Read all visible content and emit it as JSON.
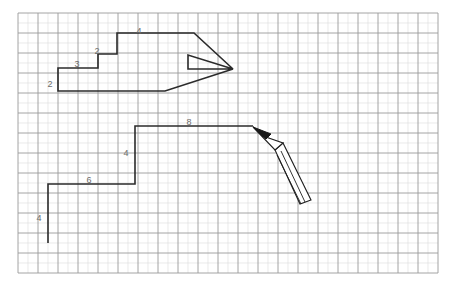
{
  "canvas": {
    "width": 452,
    "height": 288,
    "background_color": "#ffffff"
  },
  "grid": {
    "name": "graph-paper-grid",
    "origin_x": 18,
    "origin_y": 13,
    "cell_size": 20,
    "sub_divisions": 2,
    "columns": 21,
    "rows": 13,
    "major_line_color": "#9a9a9a",
    "minor_line_color": "#dcdcdc",
    "major_line_width": 0.9,
    "minor_line_width": 0.6
  },
  "drawing": {
    "stroke_color": "#2b2b2b",
    "stroke_width": 1.6,
    "label_color": "#6d6d6d",
    "shapes": [
      {
        "id": "arrow-polygon",
        "name": "arrow-shape",
        "type": "polygon",
        "closed": true,
        "points": [
          [
            58,
            68
          ],
          [
            58,
            91
          ],
          [
            165,
            91
          ],
          [
            233,
            69
          ],
          [
            188,
            69
          ],
          [
            188,
            55
          ],
          [
            233,
            69
          ],
          [
            194,
            33
          ],
          [
            117,
            33
          ],
          [
            117,
            54
          ],
          [
            98,
            54
          ],
          [
            98,
            68
          ]
        ],
        "path": "M 58 68 L 58 91 L 165 91 L 233 69 L 188 69 L 188 55 L 233 69 L 194 33 L 117 33 L 117 54 L 98 54 L 98 68 Z"
      },
      {
        "id": "staircase-polyline",
        "name": "staircase-shape",
        "type": "polyline",
        "closed": false,
        "points": [
          [
            48,
            243
          ],
          [
            48,
            184
          ],
          [
            135,
            184
          ],
          [
            135,
            126
          ],
          [
            253,
            126
          ]
        ],
        "path": "M 48 243 L 48 184 L 135 184 L 135 126 L 253 126"
      }
    ],
    "labels": [
      {
        "id": "label-arrow-left-2",
        "name": "length-label-2-left",
        "text": "2",
        "x": 50,
        "y": 85
      },
      {
        "id": "label-arrow-top-3",
        "name": "length-label-3-top",
        "text": "3",
        "x": 77,
        "y": 65
      },
      {
        "id": "label-arrow-step-2",
        "name": "length-label-2-step",
        "text": "2",
        "x": 97,
        "y": 52
      },
      {
        "id": "label-arrow-top-4",
        "name": "length-label-4-top",
        "text": "4",
        "x": 139,
        "y": 32
      },
      {
        "id": "label-stair-8",
        "name": "length-label-8-top",
        "text": "8",
        "x": 189,
        "y": 123
      },
      {
        "id": "label-stair-4-upper",
        "name": "length-label-4-riser",
        "text": "4",
        "x": 126,
        "y": 154
      },
      {
        "id": "label-stair-6",
        "name": "length-label-6-run",
        "text": "6",
        "x": 89,
        "y": 181
      },
      {
        "id": "label-stair-4-lower",
        "name": "length-label-4-riser-lower",
        "text": "4",
        "x": 39,
        "y": 219
      }
    ]
  },
  "cursor": {
    "name": "pencil-cursor",
    "type": "pencil",
    "tip_x": 253,
    "tip_y": 127,
    "tail_x": 311,
    "tail_y": 200,
    "tip_color": "#1a1a1a",
    "body_color": "#ffffff",
    "outline_color": "#1f1f1f",
    "tip_path": "M 253 127 L 266 139 L 271 134 Z",
    "cone_path": "M 253 127 L 275 150 L 283 143 L 263 136 Z",
    "body_path": "M 275 150 L 283 143 L 311 200 L 300 204 Z",
    "barrel_line_1": "M 281 151 L 305 202",
    "barrel_line_2": "M 277 155 L 301 204"
  }
}
